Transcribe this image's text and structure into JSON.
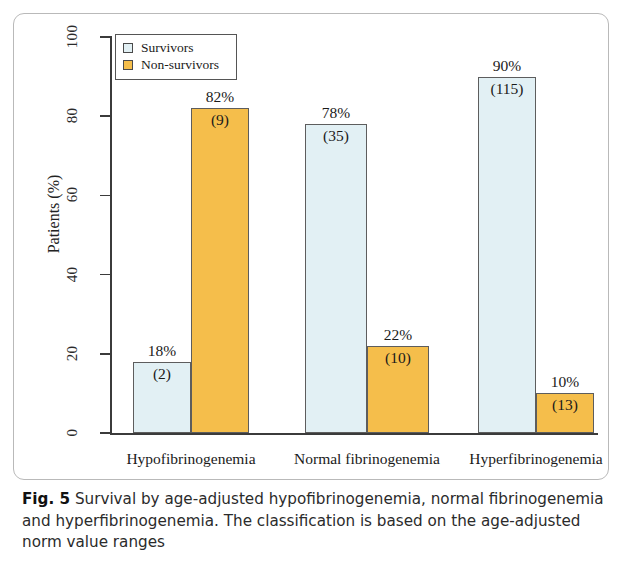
{
  "figure": {
    "caption_label": "Fig. 5",
    "caption_text": "Survival by age-adjusted hypofibrinogenemia, normal fibrinogenemia and hyperfibrinogenemia. The classification is based on the age-adjusted norm value ranges"
  },
  "colors": {
    "survivors": "#E2F0F4",
    "non_survivors": "#F5BE4B",
    "bar_border": "#5d5d5d",
    "axis": "#3b3b3b",
    "frame": "#b9b9b9"
  },
  "chart_data": {
    "type": "bar",
    "title": "",
    "xlabel": "",
    "ylabel": "Patients (%)",
    "ylim": [
      0,
      100
    ],
    "yticks": [
      0,
      20,
      40,
      60,
      80,
      100
    ],
    "ytick_labels": [
      "0",
      "20",
      "40",
      "60",
      "80",
      "100"
    ],
    "grid": false,
    "legend_position": "top-left",
    "categories": [
      "Hypofibrinogenemia",
      "Normal fibrinogenemia",
      "Hyperfibrinogenemia"
    ],
    "series": [
      {
        "name": "Survivors",
        "color": "#E2F0F4",
        "values": [
          18,
          78,
          90
        ],
        "value_labels": [
          "18%",
          "78%",
          "90%"
        ],
        "counts": [
          2,
          35,
          115
        ],
        "count_labels": [
          "(2)",
          "(35)",
          "(115)"
        ]
      },
      {
        "name": "Non-survivors",
        "color": "#F5BE4B",
        "values": [
          82,
          22,
          10
        ],
        "value_labels": [
          "82%",
          "22%",
          "10%"
        ],
        "counts": [
          9,
          10,
          13
        ],
        "count_labels": [
          "(9)",
          "(10)",
          "(13)"
        ]
      }
    ]
  }
}
